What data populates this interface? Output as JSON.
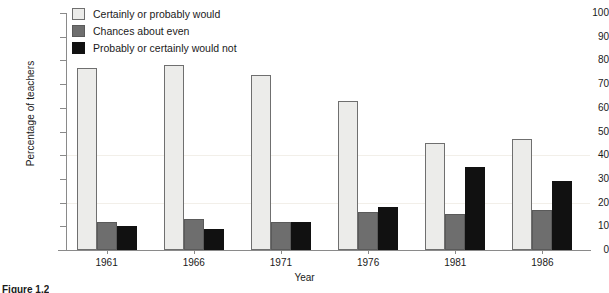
{
  "chart_data": {
    "type": "bar",
    "title": "",
    "xlabel": "Year",
    "ylabel": "Percentage of teachers",
    "categories": [
      "1961",
      "1966",
      "1971",
      "1976",
      "1981",
      "1986"
    ],
    "ylim": [
      0,
      100
    ],
    "ytick_step": 10,
    "yticks": [
      "100",
      "90",
      "80",
      "70",
      "60",
      "50",
      "40",
      "30",
      "20",
      "10",
      "0"
    ],
    "grid": "faint horizontal gridlines at 20 and 40",
    "legend_position": "top-left inside plot",
    "series": [
      {
        "name": "Certainly or probably would",
        "color": "#ececea",
        "values": [
          77,
          78,
          74,
          63,
          45,
          47
        ]
      },
      {
        "name": "Chances about even",
        "color": "#6e6e6e",
        "values": [
          12,
          13,
          12,
          16,
          15,
          17
        ]
      },
      {
        "name": "Probably or certainly would not",
        "color": "#111111",
        "values": [
          10,
          9,
          12,
          18,
          35,
          29
        ]
      }
    ]
  },
  "axes": {
    "y_title": "Percentage of teachers",
    "x_title": "Year"
  },
  "legend": {
    "items": [
      {
        "label": "Certainly or probably would"
      },
      {
        "label": "Chances about even"
      },
      {
        "label": "Probably or certainly would not"
      }
    ]
  },
  "caption": {
    "text": "Figure 1.2"
  }
}
